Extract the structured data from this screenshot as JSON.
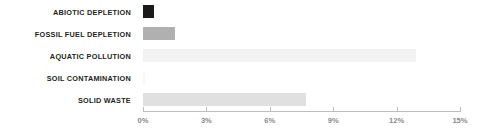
{
  "chart_data": {
    "type": "bar",
    "orientation": "horizontal",
    "title": "",
    "subtitle": "",
    "xlabel": "",
    "ylabel": "",
    "xlim": [
      0,
      15
    ],
    "grid": false,
    "legend": "none",
    "axis": {
      "tick_labels": [
        "0%",
        "3%",
        "6%",
        "9%",
        "12%",
        "15%"
      ],
      "tick_values": [
        0,
        3,
        6,
        9,
        12,
        15
      ],
      "unit": "%"
    },
    "categories": [
      "ABIOTIC DEPLETION",
      "FOSSIL FUEL DEPLETION",
      "AQUATIC POLLUTION",
      "SOIL CONTAMINATION",
      "SOLID WASTE"
    ],
    "values": [
      0.5,
      1.5,
      12.9,
      0.1,
      7.7
    ],
    "bar_colors": [
      "#1a1a1a",
      "#b0b0b0",
      "#f2f2f2",
      "#f7f7f7",
      "#e0e0e0"
    ],
    "series": [
      {
        "name": "",
        "values": [
          0.5,
          1.5,
          12.9,
          0.1,
          7.7
        ]
      }
    ],
    "bars": [
      {
        "label": "ABIOTIC DEPLETION",
        "value": 0.5,
        "color": "#1a1a1a"
      },
      {
        "label": "FOSSIL FUEL DEPLETION",
        "value": 1.5,
        "color": "#b0b0b0"
      },
      {
        "label": "AQUATIC POLLUTION",
        "value": 12.9,
        "color": "#f2f2f2"
      },
      {
        "label": "SOIL CONTAMINATION",
        "value": 0.1,
        "color": "#f7f7f7"
      },
      {
        "label": "SOLID WASTE",
        "value": 7.7,
        "color": "#e0e0e0"
      }
    ]
  },
  "style": {
    "background": "#ffffff",
    "label_color": "#231f20",
    "tick_color": "#8a8a8a",
    "axis_color": "#bcbcbc"
  }
}
